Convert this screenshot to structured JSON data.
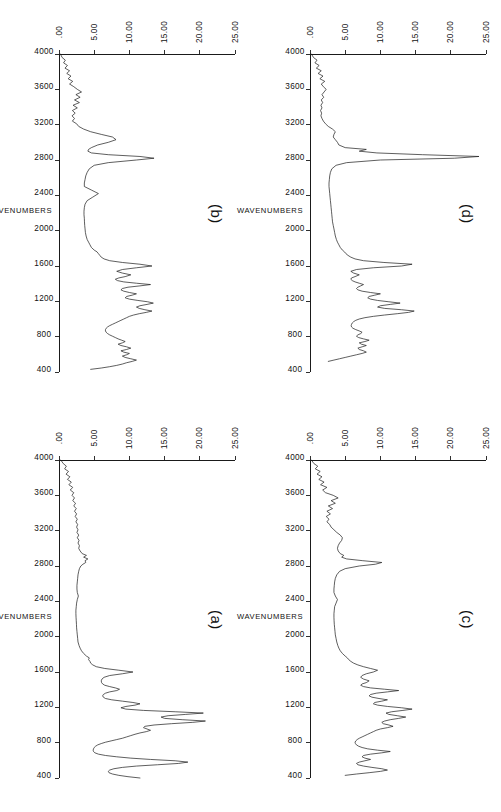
{
  "figure": {
    "orientation": "rotated-90",
    "background_color": "#ffffff",
    "line_color": "#1a1a1a",
    "panel_count": 4
  },
  "axes": {
    "x_title": "WAVENUMBERS",
    "x_ticks": [
      "4000",
      "3600",
      "3200",
      "2800",
      "2400",
      "2000",
      "1600",
      "1200",
      "800",
      "400"
    ],
    "x_min": 4000,
    "x_max": 400,
    "y_ticks": [
      ".00",
      "5.00",
      "10.00",
      "15.00",
      "20.00",
      "25.00"
    ],
    "y_min": 0,
    "y_max": 25,
    "y_title": ""
  },
  "panels": [
    {
      "id": "a",
      "tag": "(a)",
      "position": "bottom-left"
    },
    {
      "id": "b",
      "tag": "(b)",
      "position": "top-left"
    },
    {
      "id": "c",
      "tag": "(c)",
      "position": "bottom-right"
    },
    {
      "id": "d",
      "tag": "(d)",
      "position": "top-right"
    }
  ],
  "chart_data": [
    {
      "id": "a",
      "type": "line",
      "title": "(a)",
      "xlabel": "WAVENUMBERS",
      "ylabel": "",
      "xlim": [
        4000,
        400
      ],
      "ylim": [
        0,
        25
      ],
      "grid": false,
      "legend": null,
      "x": [
        4000,
        3960,
        3930,
        3900,
        3870,
        3840,
        3810,
        3780,
        3750,
        3720,
        3690,
        3660,
        3630,
        3600,
        3570,
        3540,
        3510,
        3480,
        3450,
        3420,
        3390,
        3360,
        3330,
        3300,
        3270,
        3240,
        3210,
        3180,
        3150,
        3120,
        3090,
        3060,
        3030,
        3000,
        2970,
        2940,
        2920,
        2900,
        2880,
        2860,
        2840,
        2820,
        2800,
        2770,
        2740,
        2700,
        2660,
        2620,
        2580,
        2540,
        2500,
        2460,
        2420,
        2380,
        2340,
        2300,
        2260,
        2220,
        2180,
        2140,
        2100,
        2060,
        2020,
        1980,
        1940,
        1900,
        1870,
        1840,
        1810,
        1780,
        1760,
        1740,
        1720,
        1700,
        1680,
        1660,
        1640,
        1620,
        1600,
        1580,
        1560,
        1540,
        1520,
        1500,
        1480,
        1465,
        1450,
        1435,
        1420,
        1405,
        1390,
        1375,
        1360,
        1345,
        1330,
        1315,
        1300,
        1285,
        1270,
        1255,
        1240,
        1225,
        1210,
        1195,
        1180,
        1165,
        1150,
        1135,
        1120,
        1105,
        1090,
        1075,
        1060,
        1045,
        1030,
        1015,
        1000,
        985,
        970,
        955,
        940,
        925,
        910,
        895,
        880,
        865,
        850,
        835,
        820,
        805,
        790,
        775,
        760,
        745,
        730,
        715,
        700,
        685,
        670,
        655,
        640,
        625,
        610,
        595,
        580,
        565,
        550,
        535,
        520,
        505,
        490,
        475,
        460,
        445,
        430,
        415,
        400
      ],
      "y": [
        0.25,
        0.6,
        1.05,
        0.8,
        1.35,
        1.0,
        1.55,
        1.2,
        1.75,
        1.4,
        1.95,
        1.6,
        2.1,
        1.85,
        2.2,
        1.95,
        2.35,
        2.1,
        2.45,
        2.2,
        2.5,
        2.3,
        2.6,
        2.4,
        2.65,
        2.5,
        2.7,
        2.55,
        2.8,
        2.6,
        2.85,
        2.7,
        2.9,
        2.8,
        3.0,
        3.3,
        3.9,
        3.5,
        4.1,
        3.7,
        3.8,
        3.4,
        3.1,
        2.9,
        2.8,
        2.7,
        2.65,
        2.6,
        2.55,
        2.55,
        2.6,
        2.75,
        2.6,
        2.5,
        2.45,
        2.4,
        2.4,
        2.42,
        2.45,
        2.48,
        2.5,
        2.55,
        2.6,
        2.65,
        2.7,
        2.85,
        3.0,
        3.2,
        3.5,
        3.9,
        4.3,
        4.2,
        4.4,
        4.5,
        4.8,
        5.3,
        6.5,
        8.5,
        10.5,
        9.0,
        7.2,
        6.4,
        6.1,
        6.0,
        6.05,
        6.2,
        6.5,
        7.2,
        8.0,
        8.6,
        8.2,
        7.2,
        6.6,
        6.3,
        6.2,
        6.3,
        6.6,
        7.5,
        9.0,
        10.5,
        11.5,
        10.8,
        9.5,
        8.8,
        9.5,
        12.0,
        16.5,
        20.5,
        18.0,
        15.5,
        14.5,
        15.0,
        17.5,
        20.8,
        19.0,
        16.0,
        13.5,
        12.2,
        12.0,
        12.5,
        13.0,
        12.4,
        11.5,
        10.8,
        10.2,
        9.6,
        9.0,
        8.2,
        7.4,
        6.6,
        6.0,
        5.5,
        5.2,
        5.0,
        4.9,
        4.85,
        4.9,
        5.1,
        5.6,
        6.6,
        8.2,
        10.2,
        13.0,
        16.5,
        18.3,
        17.0,
        14.0,
        11.0,
        9.0,
        7.8,
        7.2,
        7.0,
        7.1,
        7.6,
        8.5,
        9.8,
        11.5,
        13.5,
        14.8,
        14.0,
        12.0,
        9.5,
        7.0
      ]
    },
    {
      "id": "b",
      "type": "line",
      "title": "(b)",
      "xlabel": "WAVENUMBERS",
      "ylabel": "",
      "xlim": [
        4000,
        400
      ],
      "ylim": [
        0,
        25
      ],
      "grid": false,
      "legend": null,
      "x": [
        4000,
        3960,
        3930,
        3900,
        3870,
        3840,
        3810,
        3780,
        3750,
        3720,
        3690,
        3660,
        3630,
        3600,
        3570,
        3540,
        3510,
        3480,
        3450,
        3420,
        3390,
        3360,
        3330,
        3300,
        3270,
        3240,
        3210,
        3180,
        3150,
        3120,
        3090,
        3060,
        3030,
        3000,
        2970,
        2940,
        2920,
        2900,
        2880,
        2860,
        2840,
        2820,
        2800,
        2770,
        2740,
        2700,
        2660,
        2620,
        2580,
        2540,
        2500,
        2460,
        2420,
        2380,
        2340,
        2300,
        2260,
        2220,
        2180,
        2140,
        2100,
        2060,
        2020,
        1980,
        1940,
        1900,
        1870,
        1840,
        1810,
        1780,
        1760,
        1740,
        1720,
        1700,
        1680,
        1660,
        1640,
        1620,
        1600,
        1580,
        1560,
        1540,
        1520,
        1500,
        1480,
        1465,
        1450,
        1435,
        1420,
        1405,
        1390,
        1375,
        1360,
        1345,
        1330,
        1315,
        1300,
        1285,
        1270,
        1255,
        1240,
        1225,
        1210,
        1195,
        1180,
        1165,
        1150,
        1135,
        1120,
        1105,
        1090,
        1075,
        1060,
        1045,
        1030,
        1015,
        1000,
        985,
        970,
        955,
        940,
        925,
        910,
        895,
        880,
        865,
        850,
        835,
        820,
        805,
        790,
        775,
        760,
        745,
        730,
        715,
        700,
        685,
        670,
        655,
        640,
        625,
        610,
        595,
        580,
        565,
        550,
        535,
        520,
        505,
        490,
        475,
        460,
        445,
        430,
        415,
        400
      ],
      "y": [
        0.2,
        0.45,
        0.9,
        0.65,
        1.2,
        0.85,
        1.5,
        1.1,
        1.7,
        1.3,
        1.95,
        1.5,
        2.1,
        2.6,
        3.2,
        2.4,
        3.0,
        2.2,
        2.9,
        2.0,
        2.6,
        1.9,
        2.3,
        1.85,
        2.2,
        1.9,
        2.5,
        2.8,
        3.5,
        4.5,
        6.0,
        7.6,
        8.1,
        7.0,
        5.5,
        4.6,
        4.2,
        4.1,
        4.6,
        7.0,
        11.5,
        13.5,
        11.0,
        7.0,
        5.0,
        4.3,
        4.0,
        3.8,
        3.7,
        3.6,
        3.6,
        4.6,
        5.6,
        4.8,
        4.0,
        3.7,
        3.6,
        3.55,
        3.55,
        3.6,
        3.62,
        3.65,
        3.7,
        3.75,
        3.85,
        4.0,
        4.2,
        4.4,
        4.6,
        5.0,
        5.4,
        5.6,
        5.8,
        6.0,
        6.4,
        7.2,
        9.0,
        11.5,
        13.2,
        11.0,
        9.0,
        8.2,
        9.0,
        10.2,
        9.4,
        8.5,
        8.0,
        8.3,
        9.2,
        11.0,
        13.0,
        11.5,
        9.8,
        9.0,
        8.8,
        9.2,
        10.0,
        11.0,
        10.4,
        9.6,
        9.4,
        10.0,
        11.2,
        12.6,
        13.4,
        12.5,
        11.5,
        11.0,
        11.4,
        12.2,
        13.2,
        12.4,
        11.4,
        10.6,
        10.0,
        9.6,
        9.2,
        8.8,
        8.4,
        8.0,
        7.6,
        7.2,
        6.9,
        6.7,
        6.6,
        6.6,
        6.7,
        6.9,
        7.2,
        7.6,
        8.0,
        8.4,
        8.9,
        9.4,
        9.0,
        8.4,
        8.8,
        9.6,
        10.2,
        9.6,
        8.8,
        9.2,
        10.0,
        9.6,
        9.0,
        9.4,
        10.2,
        11.0,
        10.4,
        9.6,
        9.0,
        8.2,
        7.2,
        6.0,
        4.5
      ]
    },
    {
      "id": "c",
      "type": "line",
      "title": "(c)",
      "xlabel": "WAVENUMBERS",
      "ylabel": "",
      "xlim": [
        4000,
        400
      ],
      "ylim": [
        0,
        25
      ],
      "grid": false,
      "legend": null,
      "x": [
        4000,
        3960,
        3930,
        3900,
        3870,
        3840,
        3810,
        3780,
        3750,
        3720,
        3690,
        3660,
        3630,
        3600,
        3570,
        3540,
        3510,
        3480,
        3450,
        3420,
        3390,
        3360,
        3330,
        3300,
        3270,
        3240,
        3210,
        3180,
        3150,
        3120,
        3090,
        3060,
        3030,
        3000,
        2970,
        2940,
        2920,
        2900,
        2880,
        2860,
        2840,
        2820,
        2800,
        2770,
        2740,
        2700,
        2660,
        2620,
        2580,
        2540,
        2500,
        2460,
        2420,
        2380,
        2340,
        2300,
        2260,
        2220,
        2180,
        2140,
        2100,
        2060,
        2020,
        1980,
        1940,
        1900,
        1870,
        1840,
        1810,
        1780,
        1760,
        1740,
        1720,
        1700,
        1680,
        1660,
        1640,
        1620,
        1600,
        1580,
        1560,
        1540,
        1520,
        1500,
        1480,
        1465,
        1450,
        1435,
        1420,
        1405,
        1390,
        1375,
        1360,
        1345,
        1330,
        1315,
        1300,
        1285,
        1270,
        1255,
        1240,
        1225,
        1210,
        1195,
        1180,
        1165,
        1150,
        1135,
        1120,
        1105,
        1090,
        1075,
        1060,
        1045,
        1030,
        1015,
        1000,
        985,
        970,
        955,
        940,
        925,
        910,
        895,
        880,
        865,
        850,
        835,
        820,
        805,
        790,
        775,
        760,
        745,
        730,
        715,
        700,
        685,
        670,
        655,
        640,
        625,
        610,
        595,
        580,
        565,
        550,
        535,
        520,
        505,
        490,
        475,
        460,
        445,
        430,
        415,
        400
      ],
      "y": [
        0.2,
        0.55,
        1.1,
        0.75,
        1.45,
        1.0,
        1.7,
        1.25,
        2.0,
        1.5,
        2.4,
        1.8,
        2.2,
        3.3,
        4.0,
        3.0,
        3.6,
        2.6,
        3.2,
        2.4,
        2.9,
        2.3,
        2.7,
        2.4,
        2.8,
        3.0,
        3.4,
        3.8,
        4.3,
        4.6,
        4.5,
        4.2,
        4.0,
        3.9,
        4.0,
        4.3,
        4.8,
        4.5,
        5.2,
        7.5,
        10.2,
        9.3,
        7.0,
        5.0,
        4.2,
        3.8,
        3.6,
        3.5,
        3.45,
        3.4,
        3.4,
        3.6,
        3.9,
        3.7,
        3.5,
        3.45,
        3.4,
        3.4,
        3.42,
        3.45,
        3.5,
        3.55,
        3.6,
        3.7,
        3.8,
        3.95,
        4.1,
        4.3,
        4.6,
        5.0,
        5.3,
        5.5,
        5.8,
        6.2,
        6.8,
        7.6,
        8.6,
        9.6,
        9.0,
        8.0,
        7.4,
        7.2,
        7.6,
        8.4,
        8.0,
        7.4,
        7.2,
        7.6,
        8.6,
        10.6,
        12.6,
        11.0,
        9.4,
        8.6,
        8.4,
        8.8,
        9.8,
        11.0,
        10.2,
        9.2,
        9.0,
        9.6,
        11.0,
        13.0,
        14.5,
        13.2,
        11.6,
        10.8,
        11.2,
        12.4,
        13.6,
        12.6,
        11.4,
        10.6,
        10.2,
        10.4,
        11.2,
        11.8,
        11.0,
        10.0,
        9.4,
        9.0,
        8.6,
        8.2,
        7.8,
        7.4,
        7.0,
        6.7,
        6.5,
        6.4,
        6.45,
        6.6,
        6.9,
        7.4,
        8.2,
        9.6,
        11.4,
        10.2,
        8.6,
        7.6,
        7.4,
        7.8,
        8.6,
        7.8,
        7.0,
        6.6,
        6.8,
        7.6,
        8.8,
        10.2,
        11.0,
        10.0,
        8.4,
        6.6,
        5.0
      ]
    },
    {
      "id": "d",
      "type": "line",
      "title": "(d)",
      "xlabel": "WAVENUMBERS",
      "ylabel": "",
      "xlim": [
        4000,
        400
      ],
      "ylim": [
        0,
        25
      ],
      "grid": false,
      "legend": null,
      "x": [
        4000,
        3960,
        3930,
        3900,
        3870,
        3840,
        3810,
        3780,
        3750,
        3720,
        3690,
        3660,
        3630,
        3600,
        3570,
        3540,
        3510,
        3480,
        3450,
        3420,
        3390,
        3360,
        3330,
        3300,
        3270,
        3240,
        3210,
        3180,
        3150,
        3120,
        3090,
        3060,
        3030,
        3000,
        2970,
        2940,
        2920,
        2900,
        2880,
        2860,
        2840,
        2820,
        2800,
        2770,
        2740,
        2700,
        2660,
        2620,
        2580,
        2540,
        2500,
        2460,
        2420,
        2380,
        2340,
        2300,
        2260,
        2220,
        2180,
        2140,
        2100,
        2060,
        2020,
        1980,
        1940,
        1900,
        1870,
        1840,
        1810,
        1780,
        1760,
        1740,
        1720,
        1700,
        1680,
        1660,
        1640,
        1620,
        1600,
        1580,
        1560,
        1540,
        1520,
        1500,
        1480,
        1465,
        1450,
        1435,
        1420,
        1405,
        1390,
        1375,
        1360,
        1345,
        1330,
        1315,
        1300,
        1285,
        1270,
        1255,
        1240,
        1225,
        1210,
        1195,
        1180,
        1165,
        1150,
        1135,
        1120,
        1105,
        1090,
        1075,
        1060,
        1045,
        1030,
        1015,
        1000,
        985,
        970,
        955,
        940,
        925,
        910,
        895,
        880,
        865,
        850,
        835,
        820,
        805,
        790,
        775,
        760,
        745,
        730,
        715,
        700,
        685,
        670,
        655,
        640,
        625,
        610,
        595,
        580,
        565,
        550,
        535,
        520,
        505,
        490,
        475,
        460,
        445,
        430,
        415,
        400
      ],
      "y": [
        0.2,
        0.5,
        1.0,
        0.7,
        1.3,
        0.9,
        1.6,
        1.15,
        1.85,
        1.4,
        2.1,
        1.6,
        1.9,
        2.3,
        2.0,
        1.7,
        1.95,
        1.6,
        1.8,
        1.55,
        1.7,
        1.5,
        1.65,
        1.55,
        1.7,
        1.9,
        2.2,
        2.6,
        3.2,
        3.6,
        3.4,
        3.3,
        3.6,
        3.9,
        4.1,
        5.0,
        8.0,
        7.0,
        9.5,
        16.0,
        24.0,
        20.5,
        10.0,
        5.2,
        3.7,
        3.1,
        2.9,
        2.8,
        2.75,
        2.7,
        2.7,
        2.75,
        2.8,
        2.85,
        2.9,
        2.95,
        3.0,
        3.05,
        3.1,
        3.15,
        3.2,
        3.3,
        3.4,
        3.5,
        3.6,
        3.75,
        3.9,
        4.1,
        4.3,
        4.6,
        4.9,
        5.1,
        5.4,
        5.8,
        6.4,
        7.6,
        10.5,
        14.5,
        13.0,
        9.0,
        6.6,
        5.8,
        6.2,
        7.0,
        6.4,
        5.9,
        5.8,
        6.0,
        6.4,
        7.0,
        7.6,
        7.2,
        6.8,
        6.6,
        6.8,
        7.4,
        8.6,
        10.0,
        9.2,
        8.4,
        8.2,
        8.6,
        9.6,
        11.2,
        12.8,
        11.4,
        10.0,
        9.6,
        10.6,
        13.0,
        14.8,
        14.0,
        12.4,
        10.6,
        9.0,
        7.8,
        7.0,
        6.5,
        6.2,
        6.0,
        5.9,
        5.85,
        5.9,
        6.1,
        6.5,
        7.0,
        7.4,
        7.2,
        6.8,
        6.6,
        6.9,
        7.6,
        8.4,
        7.8,
        7.0,
        7.3,
        8.0,
        7.4,
        6.8,
        7.0,
        7.6,
        8.0,
        7.4,
        6.6,
        5.8,
        5.0,
        4.2,
        3.4,
        2.6
      ]
    }
  ]
}
